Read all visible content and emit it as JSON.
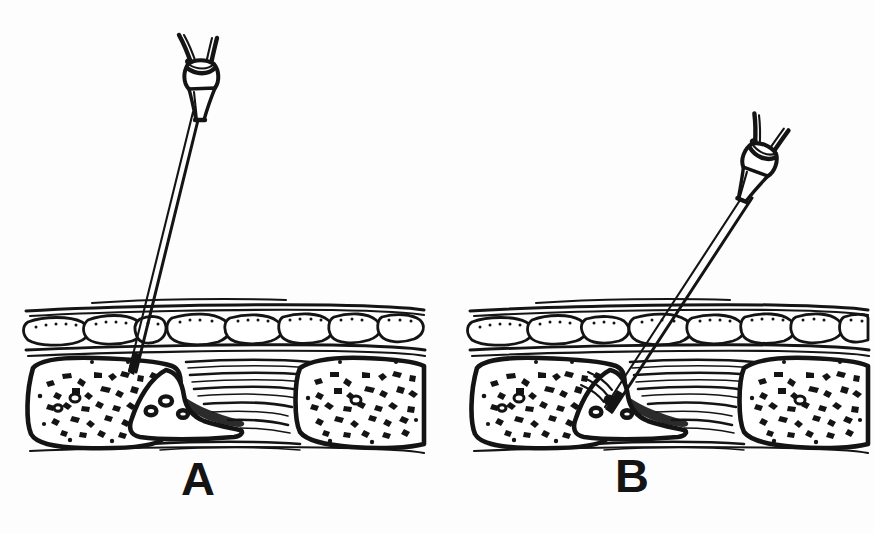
{
  "figure": {
    "background_color": "#fdfdfd",
    "ink_color": "#141414",
    "width": 874,
    "height": 534
  },
  "panels": [
    {
      "id": "A",
      "label": "A",
      "label_position": {
        "x": 181,
        "y": 455
      },
      "caption": "Perpendicular needle approach; needle tip rests on the bone surface above the process",
      "needle": {
        "name": "winged-hub-needle",
        "hub_center": {
          "x": 206,
          "y": 75
        },
        "hub_rotation_deg": 0,
        "tip": {
          "x": 132,
          "y": 372
        },
        "shaft_top": {
          "x": 196,
          "y": 112
        },
        "angle_from_vertical_deg": 14,
        "depth": "superficial — contacting periosteum"
      },
      "tissue_block": {
        "x": 25,
        "y": 300,
        "width": 400,
        "height": 150
      }
    },
    {
      "id": "B",
      "label": "B",
      "label_position": {
        "x": 615,
        "y": 452
      },
      "caption": "Oblique needle approach; needle tip advanced deeper into the process",
      "needle": {
        "name": "winged-hub-needle",
        "hub_center": {
          "x": 757,
          "y": 163
        },
        "hub_rotation_deg": 22,
        "tip": {
          "x": 608,
          "y": 410
        },
        "shaft_top": {
          "x": 746,
          "y": 196
        },
        "angle_from_vertical_deg": 34,
        "depth": "deep — entering the interspinous process"
      },
      "tissue_block": {
        "x": 468,
        "y": 300,
        "width": 400,
        "height": 150
      }
    }
  ],
  "anatomy_layers": [
    {
      "name": "skin-surface",
      "order": 1,
      "rendering": "paired horizontal ink lines"
    },
    {
      "name": "subcutaneous-fat",
      "order": 2,
      "rendering": "rounded stippled lobules"
    },
    {
      "name": "fascia",
      "order": 3,
      "rendering": "paired horizontal ink lines"
    },
    {
      "name": "muscle-fibers",
      "order": 4,
      "rendering": "dense horizontal striations"
    },
    {
      "name": "bone-left",
      "order": 5,
      "rendering": "cancellous trabecular speckle"
    },
    {
      "name": "bone-process-center",
      "order": 6,
      "rendering": "wedge with small oval lacunae"
    },
    {
      "name": "bone-right",
      "order": 7,
      "rendering": "cancellous trabecular speckle"
    }
  ],
  "instrument": {
    "name": "winged-hub-needle",
    "parts": [
      "left-wing",
      "right-wing",
      "hub-body",
      "hub-cone",
      "needle-shaft",
      "needle-tip"
    ],
    "style": "hollow double-line shaft"
  }
}
